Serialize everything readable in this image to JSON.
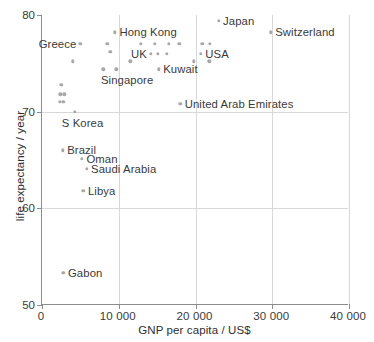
{
  "chart_data": {
    "type": "scatter",
    "title": "",
    "xlabel": "GNP per capita / US$",
    "ylabel": "life expectancy / year",
    "xlim": [
      0,
      40000
    ],
    "ylim": [
      50,
      80
    ],
    "grid": true,
    "legend": "none",
    "xticklabels": [
      "0",
      "10 000",
      "20 000",
      "30 000",
      "40 000"
    ],
    "xtickvalues": [
      0,
      10000,
      20000,
      30000,
      40000
    ],
    "yticklabels": [
      "50",
      "60",
      "70",
      "80"
    ],
    "ytickvalues": [
      50,
      60,
      70,
      80
    ],
    "marker_color": "#a8a8a8",
    "axis_color": "#8d8d8d",
    "grid_color": "#d8d8d8",
    "text_color": "#3a3a3a",
    "points": [
      {
        "name": "Greece",
        "x": 5000,
        "y": 77.0,
        "label": "Greece",
        "label_side": "left"
      },
      {
        "name": "Hong Kong",
        "x": 9500,
        "y": 78.2,
        "label": "Hong Kong",
        "label_side": "right"
      },
      {
        "name": "Japan",
        "x": 23000,
        "y": 79.4,
        "label": "Japan",
        "label_side": "right"
      },
      {
        "name": "Switzerland",
        "x": 29800,
        "y": 78.2,
        "label": "Switzerland",
        "label_side": "right"
      },
      {
        "name": "UK",
        "x": 14200,
        "y": 76.0,
        "label": "UK",
        "label_side": "left"
      },
      {
        "name": "USA",
        "x": 20700,
        "y": 76.0,
        "label": "USA",
        "label_side": "right"
      },
      {
        "name": "Singapore",
        "x": 9700,
        "y": 74.4,
        "label": "Singapore",
        "label_side": "below"
      },
      {
        "name": "Kuwait",
        "x": 15200,
        "y": 74.4,
        "label": "Kuwait",
        "label_side": "right"
      },
      {
        "name": "United Arab Emirates",
        "x": 18000,
        "y": 70.8,
        "label": "United Arab Emirates",
        "label_side": "right"
      },
      {
        "name": "S Korea",
        "x": 4300,
        "y": 70.0,
        "label": "S Korea",
        "label_side": "below"
      },
      {
        "name": "Brazil",
        "x": 2700,
        "y": 66.0,
        "label": "Brazil",
        "label_side": "right"
      },
      {
        "name": "Oman",
        "x": 5200,
        "y": 65.1,
        "label": "Oman",
        "label_side": "right"
      },
      {
        "name": "Saudi Arabia",
        "x": 5800,
        "y": 64.1,
        "label": "Saudi Arabia",
        "label_side": "right"
      },
      {
        "name": "Libya",
        "x": 5400,
        "y": 61.8,
        "label": "Libya",
        "label_side": "right"
      },
      {
        "name": "Gabon",
        "x": 2800,
        "y": 53.3,
        "label": "Gabon",
        "label_side": "right"
      },
      {
        "name": "unlabelled-1",
        "x": 4000,
        "y": 75.2,
        "label": "",
        "label_side": "none"
      },
      {
        "name": "unlabelled-2",
        "x": 2500,
        "y": 72.8,
        "label": "",
        "label_side": "none"
      },
      {
        "name": "unlabelled-3",
        "x": 2400,
        "y": 71.8,
        "label": "",
        "label_side": "none"
      },
      {
        "name": "unlabelled-4",
        "x": 2900,
        "y": 71.8,
        "label": "",
        "label_side": "none"
      },
      {
        "name": "unlabelled-5",
        "x": 2300,
        "y": 71.0,
        "label": "",
        "label_side": "none"
      },
      {
        "name": "unlabelled-6",
        "x": 2800,
        "y": 71.0,
        "label": "",
        "label_side": "none"
      },
      {
        "name": "unlabelled-7",
        "x": 8500,
        "y": 77.0,
        "label": "",
        "label_side": "none"
      },
      {
        "name": "unlabelled-8",
        "x": 8900,
        "y": 76.2,
        "label": "",
        "label_side": "none"
      },
      {
        "name": "unlabelled-9",
        "x": 8000,
        "y": 74.4,
        "label": "",
        "label_side": "none"
      },
      {
        "name": "unlabelled-10",
        "x": 11500,
        "y": 75.2,
        "label": "",
        "label_side": "none"
      },
      {
        "name": "unlabelled-11",
        "x": 12900,
        "y": 77.0,
        "label": "",
        "label_side": "none"
      },
      {
        "name": "unlabelled-12",
        "x": 14700,
        "y": 77.0,
        "label": "",
        "label_side": "none"
      },
      {
        "name": "unlabelled-13",
        "x": 16500,
        "y": 77.0,
        "label": "",
        "label_side": "none"
      },
      {
        "name": "unlabelled-14",
        "x": 17900,
        "y": 77.0,
        "label": "",
        "label_side": "none"
      },
      {
        "name": "unlabelled-15",
        "x": 15100,
        "y": 76.0,
        "label": "",
        "label_side": "none"
      },
      {
        "name": "unlabelled-16",
        "x": 16300,
        "y": 76.0,
        "label": "",
        "label_side": "none"
      },
      {
        "name": "unlabelled-17",
        "x": 20900,
        "y": 77.0,
        "label": "",
        "label_side": "none"
      },
      {
        "name": "unlabelled-18",
        "x": 21900,
        "y": 77.0,
        "label": "",
        "label_side": "none"
      },
      {
        "name": "unlabelled-19",
        "x": 19800,
        "y": 75.2,
        "label": "",
        "label_side": "none"
      },
      {
        "name": "unlabelled-20",
        "x": 21800,
        "y": 75.2,
        "label": "",
        "label_side": "none"
      }
    ]
  }
}
